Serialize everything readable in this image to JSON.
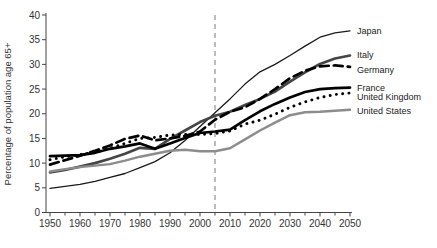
{
  "chart_data": {
    "type": "line",
    "title": "",
    "xlabel": "",
    "ylabel": "Percentage of population age 65+",
    "xlim": [
      1950,
      2050
    ],
    "ylim": [
      0,
      40
    ],
    "grid": false,
    "legend_position": "labels-at-right-line-ends",
    "axis_color": "#444444",
    "x_tick_labels": [
      "1950",
      "1960",
      "1970",
      "1980",
      "1990",
      "2000",
      "2010",
      "2020",
      "2030",
      "2040",
      "2050"
    ],
    "x_minor_ticks": [
      1955,
      1965,
      1975,
      1985,
      1995,
      2005,
      2015,
      2025,
      2035,
      2045
    ],
    "y_tick_labels": [
      "0",
      "5",
      "10",
      "15",
      "20",
      "25",
      "30",
      "35",
      "40"
    ],
    "x": [
      1950,
      1955,
      1960,
      1965,
      1970,
      1975,
      1980,
      1985,
      1990,
      1995,
      2000,
      2005,
      2010,
      2015,
      2020,
      2025,
      2030,
      2035,
      2040,
      2045,
      2050
    ],
    "series": [
      {
        "name": "Japan",
        "color": "#1a1a1a",
        "line_style": "solid",
        "line_weight": "thin",
        "values": [
          4.9,
          5.3,
          5.7,
          6.3,
          7.1,
          7.9,
          9.1,
          10.3,
          12.1,
          14.6,
          17.4,
          20.2,
          23.0,
          26.0,
          28.5,
          30.0,
          31.8,
          33.7,
          35.5,
          36.4,
          36.8
        ]
      },
      {
        "name": "Italy",
        "color": "#454545",
        "line_style": "solid",
        "line_weight": "thick",
        "values": [
          8.1,
          8.6,
          9.3,
          10.0,
          10.9,
          11.9,
          13.1,
          12.9,
          14.9,
          16.6,
          18.3,
          19.6,
          20.4,
          21.8,
          23.0,
          24.5,
          26.5,
          28.4,
          30.1,
          31.2,
          31.8
        ]
      },
      {
        "name": "Germany",
        "color": "#000000",
        "line_style": "dashed",
        "line_weight": "thick",
        "values": [
          9.7,
          10.6,
          11.5,
          12.5,
          13.6,
          14.9,
          15.6,
          14.6,
          15.0,
          15.5,
          16.4,
          18.8,
          20.4,
          21.3,
          23.0,
          25.0,
          27.2,
          28.7,
          29.6,
          29.8,
          29.5
        ]
      },
      {
        "name": "France",
        "color": "#000000",
        "line_style": "solid",
        "line_weight": "thick",
        "values": [
          11.4,
          11.5,
          11.6,
          12.1,
          12.9,
          13.4,
          14.0,
          12.9,
          14.0,
          15.1,
          16.1,
          16.4,
          16.8,
          18.7,
          20.5,
          22.0,
          23.3,
          24.4,
          25.0,
          25.2,
          25.3
        ]
      },
      {
        "name": "United Kingdom",
        "color": "#000000",
        "line_style": "dotted",
        "line_weight": "thick",
        "values": [
          10.7,
          11.3,
          11.7,
          12.2,
          13.0,
          14.0,
          15.0,
          15.2,
          15.7,
          15.8,
          15.8,
          16.0,
          16.5,
          17.9,
          18.7,
          19.9,
          21.3,
          22.4,
          23.3,
          23.9,
          24.2
        ]
      },
      {
        "name": "United States",
        "color": "#8c8c8c",
        "line_style": "solid",
        "line_weight": "medium",
        "values": [
          8.3,
          8.8,
          9.2,
          9.5,
          9.8,
          10.5,
          11.3,
          11.9,
          12.5,
          12.7,
          12.4,
          12.4,
          13.0,
          14.8,
          16.6,
          18.2,
          19.7,
          20.3,
          20.4,
          20.6,
          20.8
        ]
      }
    ],
    "annotations": [
      {
        "type": "vline",
        "x": 2005,
        "style": "dashed",
        "color": "#999999"
      }
    ]
  }
}
